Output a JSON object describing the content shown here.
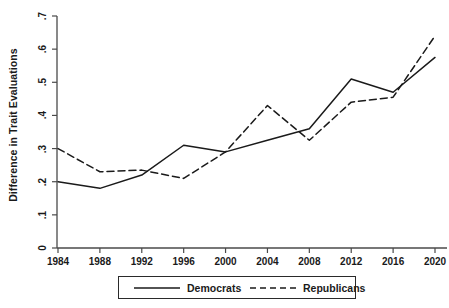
{
  "chart_data": {
    "type": "line",
    "title": "",
    "subtitle": "",
    "xlabel": "",
    "ylabel": "Difference in Trait Evaluations",
    "categories": [
      1984,
      1988,
      1992,
      1996,
      2000,
      2004,
      2008,
      2012,
      2016,
      2020
    ],
    "x_tick_labels": [
      "1984",
      "1988",
      "1992",
      "1996",
      "2000",
      "2004",
      "2008",
      "2012",
      "2016",
      "2020"
    ],
    "y_tick_labels": [
      "0",
      ".1",
      ".2",
      ".3",
      ".4",
      ".5",
      ".6",
      ".7"
    ],
    "y_tick_values": [
      0,
      0.1,
      0.2,
      0.3,
      0.4,
      0.5,
      0.6,
      0.7
    ],
    "xlim": [
      1984,
      2020
    ],
    "ylim": [
      0,
      0.7
    ],
    "grid": false,
    "legend_position": "bottom-outside",
    "series": [
      {
        "name": "Democrats",
        "style": "solid",
        "color": "#1a1a1a",
        "values": [
          0.2,
          0.18,
          0.22,
          0.31,
          0.29,
          0.325,
          0.36,
          0.51,
          0.47,
          0.575
        ]
      },
      {
        "name": "Republicans",
        "style": "dashed",
        "color": "#1a1a1a",
        "values": [
          0.3,
          0.23,
          0.235,
          0.21,
          0.29,
          0.43,
          0.325,
          0.44,
          0.455,
          0.64
        ]
      }
    ]
  },
  "legend": {
    "items": [
      {
        "label": "Democrats"
      },
      {
        "label": "Republicans"
      }
    ]
  },
  "axes": {
    "y_axis_title": "Difference in Trait Evaluations"
  }
}
